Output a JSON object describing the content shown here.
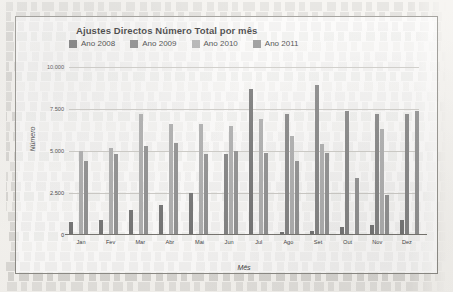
{
  "chart_data": {
    "type": "bar",
    "title": "Ajustes Directos Número Total por mês",
    "xlabel": "Mês",
    "ylabel": "Número",
    "ylim": [
      0,
      10000
    ],
    "yticks": [
      0,
      2500,
      5000,
      7500,
      10000
    ],
    "ytick_labels": [
      "0",
      "2.500",
      "5.000",
      "7.500",
      "10.000"
    ],
    "grid": true,
    "legend_position": "top-left",
    "categories": [
      "Jan",
      "Fev",
      "Mar",
      "Abr",
      "Mai",
      "Jun",
      "Jul",
      "Ago",
      "Set",
      "Out",
      "Nov",
      "Dez"
    ],
    "series": [
      {
        "name": "Ano 2008",
        "color": "#6e6e6e",
        "values": [
          800,
          900,
          1500,
          1800,
          2500,
          0,
          8700,
          150,
          250,
          500,
          600,
          900
        ]
      },
      {
        "name": "Ano 2009",
        "color": "#7d7d7d",
        "values": [
          0,
          0,
          0,
          0,
          0,
          4800,
          0,
          7200,
          8900,
          7400,
          7200,
          7200
        ]
      },
      {
        "name": "Ano 2010",
        "color": "#a9a9a9",
        "values": [
          5000,
          5200,
          7200,
          6600,
          6600,
          6500,
          6900,
          5900,
          5400,
          0,
          6300,
          0
        ]
      },
      {
        "name": "Ano 2011",
        "color": "#8a8a8a",
        "values": [
          4400,
          4800,
          5300,
          5500,
          4800,
          5000,
          4900,
          4400,
          4900,
          3400,
          2400,
          7400
        ]
      }
    ]
  }
}
